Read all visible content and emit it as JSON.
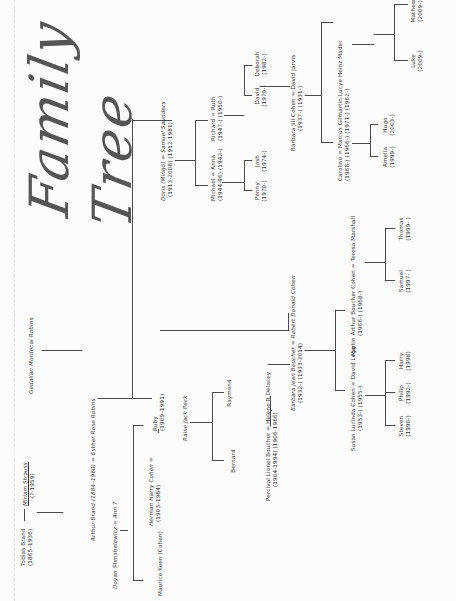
{
  "document": {
    "title": "Family Tree",
    "orientation": "rotated 90° counter-clockwise",
    "people": {
      "tobias": {
        "name": "Tobias Brand",
        "dates": "(1865–1936)"
      },
      "miriam": {
        "name": "Miriam Strauss",
        "dates": "(?-1959)"
      },
      "gedalian": {
        "name": "Gedalian Mordecai Robins"
      },
      "arthur": {
        "name": "Arthur Brand (1884–1960) = Esther Rose Robins"
      },
      "doyan": {
        "name": "Doyan Shmshelewicz = Ann ?"
      },
      "maurice": {
        "name": "Maurice Keen (Cohen)"
      },
      "herman": {
        "name": "Herman Harry Cohen =",
        "dates": "(1903–1984)"
      },
      "ruby": {
        "name": "Ruby",
        "dates": "(1909–1991)"
      },
      "doris": {
        "name": "Doris (Mingo) = Samuel Saunders",
        "dates": "(1913-2008)   (1912-1981)"
      },
      "raise": {
        "name": "Raise Jack Peck"
      },
      "bernard": {
        "name": "Bernard"
      },
      "raymond": {
        "name": "Raymond"
      },
      "percival": {
        "name": "Percival Lionel Boucher = Helene R Delacey",
        "dates": "(1904-1994)      (1906-1966)"
      },
      "michael": {
        "name": "Michael = Anna",
        "dates": "(1944-96)   (1942-)"
      },
      "richard": {
        "name": "Richard = Ruth",
        "dates": "(1947-)   (1950-)"
      },
      "penny": {
        "name": "Penny",
        "dates": "(1970-)"
      },
      "josh": {
        "name": "Josh",
        "dates": "(1974-)"
      },
      "david": {
        "name": "David",
        "dates": "(1979-)"
      },
      "deborah": {
        "name": "Deborah",
        "dates": "(1982-)"
      },
      "barbara_joan": {
        "name": "Barbara Joan Boucher = Robert Donald Cohen",
        "dates": "(1932-)         (1933-2014)"
      },
      "barbara_jill": {
        "name": "Barbara Jill Cohen = David Jarvis",
        "dates": "(1937-)      (1931-)"
      },
      "susan": {
        "name": "Susan Lucinda Cohen = David Legg",
        "dates": "(1953-)      (1955-)"
      },
      "martin": {
        "name": "Martin Arthur Boucher Cohen = Teresa Marshall",
        "dates": "(1966-)      (1968-)"
      },
      "caroline": {
        "name": "Caroline = Marcus Gilmartin  Lucye Heinz Mader",
        "dates": "(1968-)  (1966-)   (1971-)  (1962-)"
      },
      "steven": {
        "name": "Steven",
        "dates": "(1990-)"
      },
      "philip": {
        "name": "Philip",
        "dates": "(1992-)"
      },
      "harry": {
        "name": "Harry",
        "dates": "(1998)"
      },
      "samuel": {
        "name": "Samuel",
        "dates": "(1997- )"
      },
      "thomas": {
        "name": "Thomas",
        "dates": "(1999- )"
      },
      "amelia": {
        "name": "Amelia",
        "dates": "(1999-)"
      },
      "hugo": {
        "name": "Hugo",
        "dates": "(2003-)"
      },
      "luke": {
        "name": "Luke",
        "dates": "(2009-)"
      },
      "mathew": {
        "name": "Mathew",
        "dates": "(2009-)"
      }
    }
  }
}
